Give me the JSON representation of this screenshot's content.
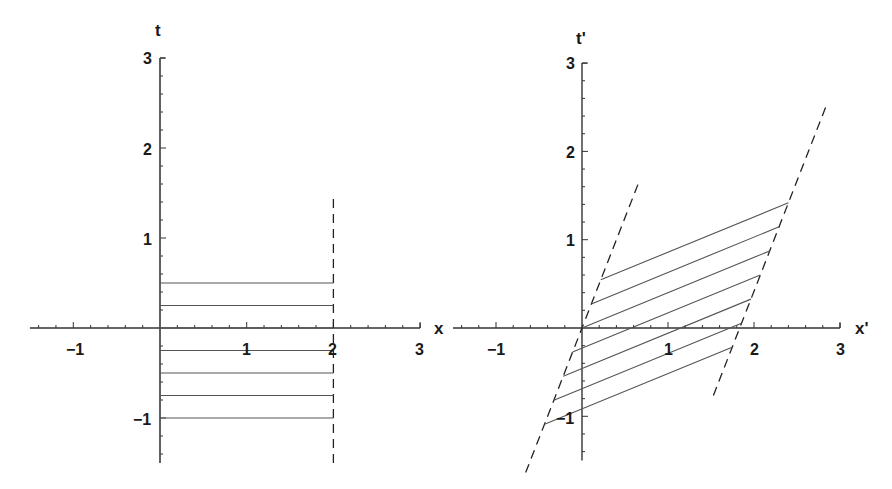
{
  "chart_data": [
    {
      "type": "line",
      "title": "",
      "xlabel": "x",
      "ylabel": "t",
      "xlim": [
        -1.5,
        3
      ],
      "ylim": [
        -1.5,
        3
      ],
      "grid": false,
      "x_ticks": [
        -1,
        1,
        2,
        3
      ],
      "y_ticks": [
        -1,
        1,
        2,
        3
      ],
      "x_tick_labels": [
        "−1",
        "1",
        "2",
        "3"
      ],
      "y_tick_labels": [
        "−1",
        "1",
        "2",
        "3"
      ],
      "series": [
        {
          "name": "worldline x=0",
          "style": "solid",
          "points": [
            [
              0,
              -1.5
            ],
            [
              0,
              3
            ]
          ]
        },
        {
          "name": "worldline x=2",
          "style": "dashed",
          "points": [
            [
              2,
              -1.5
            ],
            [
              2,
              1.5
            ]
          ]
        },
        {
          "name": "simultaneity t=0.5",
          "style": "solid",
          "points": [
            [
              0,
              0.5
            ],
            [
              2,
              0.5
            ]
          ]
        },
        {
          "name": "simultaneity t=0.25",
          "style": "solid",
          "points": [
            [
              0,
              0.25
            ],
            [
              2,
              0.25
            ]
          ]
        },
        {
          "name": "simultaneity t=0",
          "style": "solid",
          "points": [
            [
              0,
              0
            ],
            [
              2,
              0
            ]
          ]
        },
        {
          "name": "simultaneity t=-0.25",
          "style": "solid",
          "points": [
            [
              0,
              -0.25
            ],
            [
              2,
              -0.25
            ]
          ]
        },
        {
          "name": "simultaneity t=-0.5",
          "style": "solid",
          "points": [
            [
              0,
              -0.5
            ],
            [
              2,
              -0.5
            ]
          ]
        },
        {
          "name": "simultaneity t=-0.75",
          "style": "solid",
          "points": [
            [
              0,
              -0.75
            ],
            [
              2,
              -0.75
            ]
          ]
        },
        {
          "name": "simultaneity t=-1",
          "style": "solid",
          "points": [
            [
              0,
              -1
            ],
            [
              2,
              -1
            ]
          ]
        }
      ]
    },
    {
      "type": "line",
      "title": "",
      "xlabel": "x'",
      "ylabel": "t'",
      "xlim": [
        -1.5,
        3
      ],
      "ylim": [
        -1.5,
        3
      ],
      "grid": false,
      "x_ticks": [
        -1,
        1,
        2,
        3
      ],
      "y_ticks": [
        -1,
        1,
        2,
        3
      ],
      "x_tick_labels": [
        "−1",
        "1",
        "2",
        "3"
      ],
      "y_tick_labels": [
        "−1",
        "1",
        "2",
        "3"
      ],
      "transform": {
        "beta": 0.4,
        "gamma": 1.0911
      },
      "series": [
        {
          "name": "worldline x=0 (boosted)",
          "style": "dashed",
          "points": [
            [
              -0.655,
              -1.637
            ],
            [
              0.655,
              1.637
            ]
          ]
        },
        {
          "name": "worldline x=2 (boosted)",
          "style": "dashed",
          "points": [
            [
              1.528,
              -0.764
            ],
            [
              2.837,
              2.51
            ]
          ]
        },
        {
          "name": "t=0.5 (boosted)",
          "style": "solid",
          "points": [
            [
              0.218,
              0.546
            ],
            [
              2.4,
              1.418
            ]
          ]
        },
        {
          "name": "t=0.25 (boosted)",
          "style": "solid",
          "points": [
            [
              0.109,
              0.273
            ],
            [
              2.291,
              1.146
            ]
          ]
        },
        {
          "name": "t=0 (boosted)",
          "style": "solid",
          "points": [
            [
              0,
              0
            ],
            [
              2.182,
              0.873
            ]
          ]
        },
        {
          "name": "t=-0.25 (boosted)",
          "style": "solid",
          "points": [
            [
              -0.109,
              -0.273
            ],
            [
              2.073,
              0.6
            ]
          ]
        },
        {
          "name": "t=-0.5 (boosted)",
          "style": "solid",
          "points": [
            [
              -0.218,
              -0.546
            ],
            [
              1.964,
              0.327
            ]
          ]
        },
        {
          "name": "t=-0.75 (boosted)",
          "style": "solid",
          "points": [
            [
              -0.327,
              -0.818
            ],
            [
              1.855,
              0.055
            ]
          ]
        },
        {
          "name": "t=-1 (boosted)",
          "style": "solid",
          "points": [
            [
              -0.436,
              -1.091
            ],
            [
              1.746,
              -0.218
            ]
          ]
        }
      ]
    }
  ],
  "left_plot": {
    "x_axis_label": "x",
    "y_axis_label": "t",
    "x_ticks": [
      "−1",
      "1",
      "2",
      "3"
    ],
    "y_ticks": [
      "−1",
      "1",
      "2",
      "3"
    ]
  },
  "right_plot": {
    "x_axis_label": "x'",
    "y_axis_label": "t'",
    "x_ticks": [
      "−1",
      "1",
      "2",
      "3"
    ],
    "y_ticks": [
      "−1",
      "1",
      "2",
      "3"
    ]
  },
  "colors": {
    "axis": "#333333",
    "line": "#555555",
    "dash": "#222222",
    "text": "#1a1a1a"
  }
}
